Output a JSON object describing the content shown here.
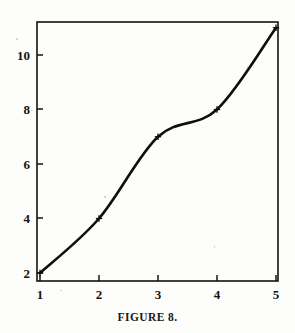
{
  "caption": "FIGURE 8.",
  "colors": {
    "background": "#fdfdfc",
    "ink": "#100e0c",
    "frame": "#141210"
  },
  "chart_data": {
    "type": "line",
    "title": "",
    "subtitle": "",
    "xlabel": "",
    "ylabel": "",
    "x": [
      1,
      2,
      3,
      4,
      5
    ],
    "values": [
      2,
      4,
      7,
      8,
      11
    ],
    "series": [
      {
        "name": "interpolating curve",
        "x": [
          1,
          2,
          3,
          4,
          5
        ],
        "values": [
          2,
          4,
          7,
          8,
          11
        ]
      }
    ],
    "point_labels": [
      "(1, 2)",
      "(2, 4)",
      "(3, 7)",
      "(4, 8)",
      "(5, 11)"
    ],
    "marker": "plus-cross",
    "interpolation": "smooth-spline",
    "xlim": [
      0.95,
      5.05
    ],
    "ylim": [
      1.5,
      11.35
    ],
    "xticks": [
      1,
      2,
      3,
      4,
      5
    ],
    "xtick_labels": [
      "1",
      "2",
      "3",
      "4",
      "5"
    ],
    "yticks": [
      2,
      4,
      6,
      8,
      10
    ],
    "ytick_labels": [
      "2",
      "4",
      "6",
      "8",
      "10"
    ],
    "grid": false,
    "legend": false,
    "legend_position": "none",
    "frame": "box"
  }
}
